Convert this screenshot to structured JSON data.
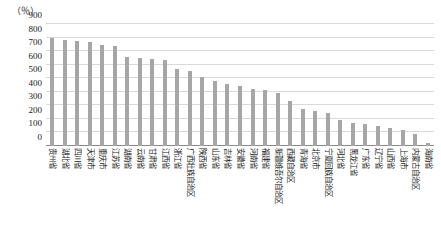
{
  "chart_data": {
    "type": "bar",
    "title": "",
    "xlabel": "",
    "ylabel": "（％）",
    "ylim": [
      0,
      900
    ],
    "ytick_step": 100,
    "yticks": [
      "900",
      "800",
      "700",
      "600",
      "500",
      "400",
      "300",
      "200",
      "100",
      "0"
    ],
    "grid": true,
    "legend": "none",
    "bar_color": "#a6a6a6",
    "categories": [
      "贵州省",
      "湖北省",
      "四川省",
      "天津市",
      "重庆市",
      "江苏省",
      "湖南省",
      "云南省",
      "甘肃省",
      "江西省",
      "浙江省",
      "广西壮族自治区",
      "陕西省",
      "山东省",
      "吉林省",
      "安徽省",
      "河南省",
      "福建省",
      "新疆维吾尔自治区",
      "西藏自治区",
      "青海省",
      "北京市",
      "宁夏回族自治区",
      "河北省",
      "黑龙江省",
      "广东省",
      "辽宁省",
      "山西省",
      "上海市",
      "内蒙古自治区",
      "海南省"
    ],
    "values": [
      800,
      785,
      775,
      770,
      745,
      735,
      660,
      650,
      640,
      635,
      570,
      555,
      510,
      480,
      460,
      440,
      420,
      415,
      390,
      330,
      270,
      255,
      245,
      195,
      170,
      160,
      150,
      130,
      120,
      90,
      20
    ]
  }
}
